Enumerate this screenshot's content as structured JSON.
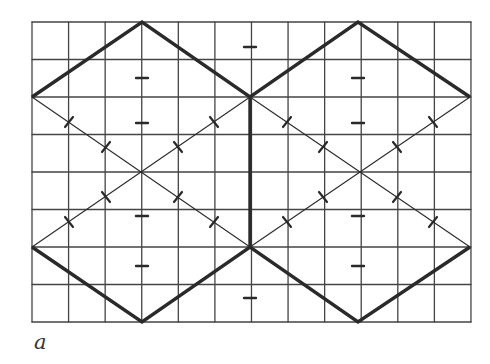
{
  "figure": {
    "label": "a",
    "colors": {
      "line": "#2a2a2a",
      "grid": "#444444",
      "background": "#ffffff"
    },
    "grid": {
      "x0": 32,
      "y0": 22,
      "cols": 12,
      "rows": 8,
      "cell_w": 36.58,
      "cell_h": 37.5
    },
    "thick_paths": [
      [
        [
          32,
          97
        ],
        [
          142,
          22
        ],
        [
          250,
          97
        ],
        [
          358,
          22
        ],
        [
          470,
          97
        ]
      ],
      [
        [
          32,
          247
        ],
        [
          142,
          322
        ],
        [
          250,
          247
        ],
        [
          358,
          322
        ],
        [
          470,
          247
        ]
      ],
      [
        [
          250,
          97
        ],
        [
          250,
          247
        ]
      ]
    ],
    "thin_lines": [
      [
        [
          32,
          97
        ],
        [
          250,
          247
        ]
      ],
      [
        [
          32,
          247
        ],
        [
          250,
          97
        ]
      ],
      [
        [
          250,
          97
        ],
        [
          470,
          247
        ]
      ],
      [
        [
          250,
          247
        ],
        [
          470,
          97
        ]
      ]
    ],
    "tick_marks": [
      [
        250,
        47,
        "h"
      ],
      [
        142,
        78,
        "h"
      ],
      [
        142,
        123,
        "h"
      ],
      [
        142,
        216,
        "h"
      ],
      [
        142,
        266,
        "h"
      ],
      [
        358,
        78,
        "h"
      ],
      [
        358,
        123,
        "h"
      ],
      [
        358,
        216,
        "h"
      ],
      [
        358,
        266,
        "h"
      ],
      [
        250,
        298,
        "h"
      ],
      [
        69,
        122,
        "d1"
      ],
      [
        106,
        147,
        "d1"
      ],
      [
        178,
        147,
        "d2"
      ],
      [
        214,
        122,
        "d2"
      ],
      [
        69,
        222,
        "d2"
      ],
      [
        106,
        197,
        "d2"
      ],
      [
        178,
        197,
        "d1"
      ],
      [
        214,
        222,
        "d1"
      ],
      [
        287,
        122,
        "d1"
      ],
      [
        323,
        147,
        "d1"
      ],
      [
        397,
        147,
        "d2"
      ],
      [
        433,
        122,
        "d2"
      ],
      [
        287,
        222,
        "d2"
      ],
      [
        323,
        197,
        "d2"
      ],
      [
        397,
        197,
        "d1"
      ],
      [
        433,
        222,
        "d1"
      ]
    ]
  }
}
